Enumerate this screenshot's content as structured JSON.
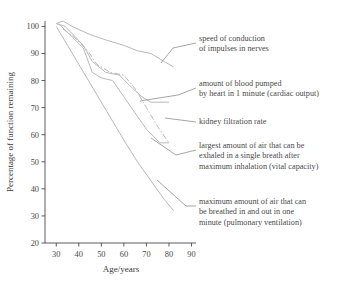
{
  "chart_data": {
    "type": "line",
    "title": "",
    "xlabel": "Age/years",
    "ylabel": "Percentage of function remaining",
    "xlim": [
      25,
      92
    ],
    "ylim": [
      20,
      102
    ],
    "xticks": [
      30,
      40,
      50,
      60,
      70,
      80,
      90
    ],
    "yticks": [
      20,
      30,
      40,
      50,
      60,
      70,
      80,
      90,
      100
    ],
    "grid": false,
    "legend_position": "inline-annotations",
    "series": [
      {
        "name": "speed of conduction of impulses in nerves",
        "style": "solid",
        "x": [
          30,
          33,
          37,
          45,
          52,
          60,
          66,
          72,
          78,
          82
        ],
        "y": [
          101,
          102,
          100,
          97,
          95,
          93,
          91,
          90,
          87,
          85
        ]
      },
      {
        "name": "amount of blood pumped by heart in 1 minute (cardiac output)",
        "style": "solid",
        "x": [
          30,
          34,
          42,
          46,
          52,
          58,
          64,
          68,
          72,
          80
        ],
        "y": [
          101,
          100,
          93,
          87,
          83,
          82,
          77,
          74,
          72,
          72
        ]
      },
      {
        "name": "kidney filtration rate",
        "style": "dash-dot",
        "x": [
          33,
          38,
          44,
          48,
          54,
          60,
          65,
          70,
          75,
          80
        ],
        "y": [
          99,
          96,
          91,
          86,
          83,
          82,
          77,
          70,
          63,
          57
        ]
      },
      {
        "name": "largest amount of air that can be exhaled in a single breath after maximum inhalation (vital capacity)",
        "style": "solid",
        "x": [
          31,
          36,
          42,
          46,
          50,
          55,
          60,
          65,
          70,
          76,
          80
        ],
        "y": [
          101,
          97,
          92,
          83,
          81,
          80,
          74,
          68,
          62,
          57,
          57
        ]
      },
      {
        "name": "maximum amount of air that can be breathed in and out in one minute (pulmonary ventilation)",
        "style": "solid",
        "x": [
          30,
          35,
          40,
          45,
          50,
          55,
          60,
          66,
          72,
          78,
          82
        ],
        "y": [
          100,
          93,
          86,
          79,
          72,
          65,
          58,
          50,
          43,
          36,
          32
        ]
      }
    ]
  },
  "axes": {
    "x_label": "Age/years",
    "y_label": "Percentage of function remaining",
    "x_tick_labels": [
      "30",
      "40",
      "50",
      "60",
      "70",
      "80",
      "90"
    ],
    "y_tick_labels": [
      "20",
      "30",
      "40",
      "50",
      "60",
      "70",
      "80",
      "90",
      "100"
    ]
  },
  "annotations": [
    {
      "id": "nerve",
      "line1": "speed of conduction",
      "line2": "of impulses in nerves",
      "line3": ""
    },
    {
      "id": "cardiac",
      "line1": "amount of blood pumped",
      "line2": "by heart in 1 minute (cardiac output)",
      "line3": ""
    },
    {
      "id": "kidney",
      "line1": "kidney filtration rate",
      "line2": "",
      "line3": ""
    },
    {
      "id": "vital",
      "line1": "largest amount of air that can be",
      "line2": "exhaled in a single breath after",
      "line3": "maximum inhalation (vital capacity)"
    },
    {
      "id": "pulmonary",
      "line1": "maximum amount of air that can",
      "line2": "be breathed in and out in one",
      "line3": "minute (pulmonary ventilation)"
    }
  ],
  "colors": {
    "axis": "#4a4a4a",
    "text": "#4a4a4a",
    "curve": "#b9b9b9",
    "leader": "#8e8e8e"
  }
}
